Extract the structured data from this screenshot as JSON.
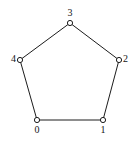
{
  "figure": {
    "name": "pentagon-cycle-graph",
    "width": 139,
    "height": 144,
    "background_color": "#ffffff",
    "edge_color": "#1c1c1c",
    "node_stroke_color": "#1c1c1c",
    "node_fill_color": "#ffffff",
    "label_color": "#141414",
    "edge_width": 1,
    "node_radius": 2.6
  },
  "chart_data": {
    "type": "graph",
    "title": "",
    "layout": "circular",
    "directed": false,
    "node_count": 5,
    "edge_count": 5,
    "nodes": [
      {
        "id": "0",
        "label": "0",
        "x": 37,
        "y": 120,
        "label_x": 37,
        "label_y": 125,
        "label_pos": "below"
      },
      {
        "id": "1",
        "label": "1",
        "x": 103,
        "y": 120,
        "label_x": 103,
        "label_y": 125,
        "label_pos": "below"
      },
      {
        "id": "2",
        "label": "2",
        "x": 119,
        "y": 60,
        "label_x": 123,
        "label_y": 59,
        "label_pos": "right"
      },
      {
        "id": "3",
        "label": "3",
        "x": 70,
        "y": 23,
        "label_x": 70,
        "label_y": 18,
        "label_pos": "above"
      },
      {
        "id": "4",
        "label": "4",
        "x": 20,
        "y": 60,
        "label_x": 16,
        "label_y": 59,
        "label_pos": "left"
      }
    ],
    "edges": [
      {
        "source": "0",
        "target": "1"
      },
      {
        "source": "1",
        "target": "2"
      },
      {
        "source": "2",
        "target": "3"
      },
      {
        "source": "3",
        "target": "4"
      },
      {
        "source": "4",
        "target": "0"
      }
    ]
  }
}
